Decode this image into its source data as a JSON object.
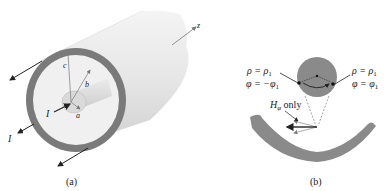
{
  "figure_a": {
    "caption": "(a)",
    "labels": {
      "z_axis": "z",
      "radius_c": "c",
      "radius_b": "b",
      "radius_a": "a",
      "current_in": "I",
      "current_out": "I"
    }
  },
  "figure_b": {
    "caption": "(b)",
    "left_point": {
      "rho": "ρ = ρ",
      "rho_sub": "1",
      "phi": "φ = −φ",
      "phi_sub": "1"
    },
    "right_point": {
      "rho": "ρ = ρ",
      "rho_sub": "1",
      "phi": "φ = φ",
      "phi_sub": "1"
    },
    "field_label": {
      "symbol": "H",
      "subscript": "φ",
      "suffix": " only"
    }
  },
  "colors": {
    "outer_ring": "#7a7a7a",
    "cylinder_light": "#eeeeee",
    "cylinder_shade": "#d6d6d6",
    "inner_conductor": "#dcdcdc",
    "section_fill": "#8a8a8a",
    "arrow": "#222222"
  }
}
